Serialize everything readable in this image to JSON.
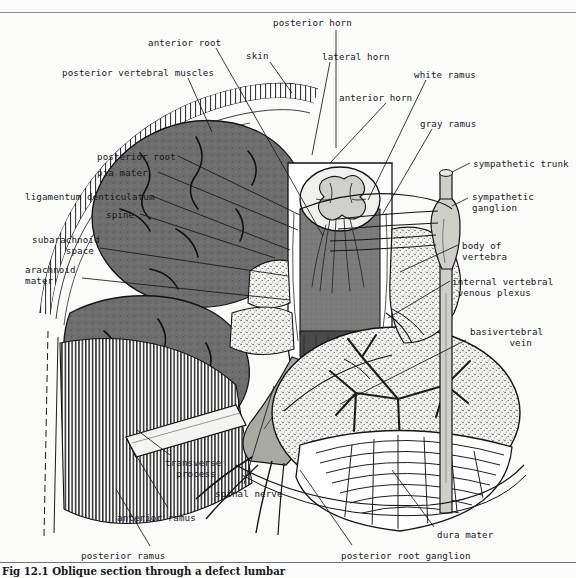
{
  "figure": {
    "caption": "Fig 12.1 Oblique section through a defect lumbar",
    "type": "anatomical-illustration",
    "style": "black-and-white line drawing with stipple and hatching"
  },
  "colors": {
    "page_background": "#fbfbfa",
    "ink": "#16181a",
    "rule": "#8a8d90",
    "muscle_gray": "#6e6e6e",
    "cord_gray": "#787878",
    "nerve_gray": "#a9a9a4",
    "bone_light": "#f2f2ef",
    "white": "#ffffff"
  },
  "labels": [
    {
      "id": "posterior-horn",
      "text": "posterior horn",
      "x": 273,
      "y": 18,
      "align": "left"
    },
    {
      "id": "anterior-root",
      "text": "anterior root",
      "x": 148,
      "y": 38,
      "align": "left"
    },
    {
      "id": "skin",
      "text": "skin",
      "x": 246,
      "y": 51,
      "align": "left"
    },
    {
      "id": "lateral-horn",
      "text": "lateral horn",
      "x": 322,
      "y": 52,
      "align": "left"
    },
    {
      "id": "posterior-vertebral-muscles",
      "text": "posterior vertebral muscles",
      "x": 62,
      "y": 68,
      "align": "left"
    },
    {
      "id": "white-ramus",
      "text": "white ramus",
      "x": 414,
      "y": 70,
      "align": "left"
    },
    {
      "id": "anterior-horn",
      "text": "anterior horn",
      "x": 339,
      "y": 93,
      "align": "left"
    },
    {
      "id": "gray-ramus",
      "text": "gray ramus",
      "x": 420,
      "y": 119,
      "align": "left"
    },
    {
      "id": "posterior-root",
      "text": "posterior root",
      "x": 97,
      "y": 152,
      "align": "left"
    },
    {
      "id": "sympathetic-trunk",
      "text": "sympathetic trunk",
      "x": 473,
      "y": 159,
      "align": "left"
    },
    {
      "id": "pia-mater",
      "text": "pia mater",
      "x": 97,
      "y": 168,
      "align": "left"
    },
    {
      "id": "ligamentum-denticulatum",
      "text": "ligamentum denticulatum",
      "x": 25,
      "y": 192,
      "align": "left"
    },
    {
      "id": "sympathetic-ganglion",
      "text": "sympathetic\nganglion",
      "x": 472,
      "y": 192,
      "align": "left"
    },
    {
      "id": "spine",
      "text": "spine",
      "x": 106,
      "y": 210,
      "align": "left"
    },
    {
      "id": "subarachnoid-space",
      "text": "subarachnoid\n      space",
      "x": 32,
      "y": 235,
      "align": "left"
    },
    {
      "id": "body-of-vertebra",
      "text": "body of\nvertebra",
      "x": 462,
      "y": 241,
      "align": "left"
    },
    {
      "id": "arachnoid-mater",
      "text": "arachnoid\nmater",
      "x": 25,
      "y": 265,
      "align": "left"
    },
    {
      "id": "internal-vertebral-venous-plexus",
      "text": "internal vertebral\n venous plexus",
      "x": 452,
      "y": 277,
      "align": "left"
    },
    {
      "id": "basivertebral-vein",
      "text": "basivertebral\n       vein",
      "x": 470,
      "y": 327,
      "align": "left"
    },
    {
      "id": "transverse-process",
      "text": "transverse\n  process",
      "x": 165,
      "y": 458,
      "align": "left"
    },
    {
      "id": "spinal-nerve",
      "text": "spinal nerve",
      "x": 215,
      "y": 489,
      "align": "left"
    },
    {
      "id": "anterior-ramus",
      "text": "anterior ramus",
      "x": 117,
      "y": 513,
      "align": "left"
    },
    {
      "id": "dura-mater",
      "text": "dura mater",
      "x": 437,
      "y": 530,
      "align": "left"
    },
    {
      "id": "posterior-ramus",
      "text": "posterior ramus",
      "x": 81,
      "y": 551,
      "align": "left"
    },
    {
      "id": "posterior-root-ganglion",
      "text": "posterior root ganglion",
      "x": 341,
      "y": 551,
      "align": "left"
    }
  ],
  "leaders": [
    {
      "id": "posterior-horn",
      "x1": 336,
      "y1": 30,
      "x2": 336,
      "y2": 148
    },
    {
      "id": "anterior-root",
      "x1": 216,
      "y1": 48,
      "x2": 323,
      "y2": 236
    },
    {
      "id": "skin",
      "x1": 270,
      "y1": 62,
      "x2": 292,
      "y2": 93
    },
    {
      "id": "lateral-horn",
      "x1": 330,
      "y1": 62,
      "x2": 312,
      "y2": 155
    },
    {
      "id": "posterior-vertebral-muscles",
      "x1": 188,
      "y1": 78,
      "x2": 212,
      "y2": 132
    },
    {
      "id": "white-ramus",
      "x1": 426,
      "y1": 80,
      "x2": 368,
      "y2": 200
    },
    {
      "id": "anterior-horn",
      "x1": 386,
      "y1": 103,
      "x2": 330,
      "y2": 163
    },
    {
      "id": "gray-ramus",
      "x1": 432,
      "y1": 129,
      "x2": 382,
      "y2": 215
    },
    {
      "id": "posterior-root",
      "x1": 178,
      "y1": 156,
      "x2": 300,
      "y2": 215
    },
    {
      "id": "sympathetic-trunk",
      "x1": 470,
      "y1": 163,
      "x2": 452,
      "y2": 172
    },
    {
      "id": "pia-mater",
      "x1": 158,
      "y1": 172,
      "x2": 298,
      "y2": 230
    },
    {
      "id": "ligamentum-denticulatum",
      "x1": 152,
      "y1": 196,
      "x2": 290,
      "y2": 250
    },
    {
      "id": "sympathetic-ganglion",
      "x1": 468,
      "y1": 198,
      "x2": 452,
      "y2": 206
    },
    {
      "id": "spine",
      "x1": 140,
      "y1": 214,
      "x2": 275,
      "y2": 258
    },
    {
      "id": "subarachnoid-space",
      "x1": 100,
      "y1": 248,
      "x2": 288,
      "y2": 276
    },
    {
      "id": "body-of-vertebra",
      "x1": 458,
      "y1": 245,
      "x2": 400,
      "y2": 272
    },
    {
      "id": "arachnoid-mater",
      "x1": 82,
      "y1": 278,
      "x2": 290,
      "y2": 300
    },
    {
      "id": "internal-vertebral-venous-plexus",
      "x1": 450,
      "y1": 281,
      "x2": 388,
      "y2": 318
    },
    {
      "id": "basivertebral-vein",
      "x1": 466,
      "y1": 340,
      "x2": 340,
      "y2": 404
    },
    {
      "id": "transverse-process",
      "x1": 170,
      "y1": 455,
      "x2": 137,
      "y2": 430
    },
    {
      "id": "spinal-nerve",
      "x1": 244,
      "y1": 484,
      "x2": 274,
      "y2": 386
    },
    {
      "id": "anterior-ramus",
      "x1": 168,
      "y1": 508,
      "x2": 131,
      "y2": 447
    },
    {
      "id": "dura-mater",
      "x1": 434,
      "y1": 527,
      "x2": 392,
      "y2": 470
    },
    {
      "id": "posterior-ramus",
      "x1": 150,
      "y1": 546,
      "x2": 116,
      "y2": 489
    },
    {
      "id": "posterior-root-ganglion",
      "x1": 352,
      "y1": 545,
      "x2": 300,
      "y2": 470
    }
  ]
}
